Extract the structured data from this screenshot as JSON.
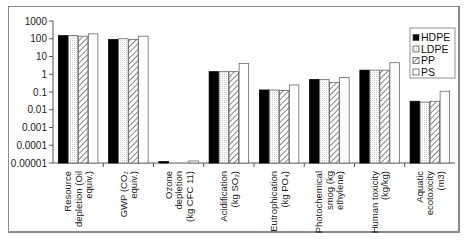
{
  "chart_data": {
    "type": "bar",
    "title": "",
    "xlabel": "",
    "ylabel": "",
    "yscale": "log",
    "ylim": [
      1e-05,
      1000
    ],
    "yticks": [
      "1000",
      "100",
      "10",
      "1",
      "0.1",
      "0.01",
      "0.001",
      "0.0001",
      "0.00001"
    ],
    "ytick_values": [
      1000,
      100,
      10,
      1,
      0.1,
      0.01,
      0.001,
      0.0001,
      1e-05
    ],
    "grid": false,
    "legend_position": "top-right",
    "categories": [
      [
        "Resource",
        "depletion (Oil",
        "equiv.)"
      ],
      [
        "GWP (CO₂",
        "equiv.)"
      ],
      [
        "Ozone",
        "depletion",
        "(kg CFC 11)"
      ],
      [
        "Acidification",
        "(kg SO₂)"
      ],
      [
        "Eutrophication",
        "(kg PO₄)"
      ],
      [
        "Photochemical",
        "smog (kg",
        "ethylene)"
      ],
      [
        "Human toxicity",
        "(kg/kg)"
      ],
      [
        "Aquatic",
        "ecotoxicity",
        "(m3)"
      ]
    ],
    "series": [
      {
        "name": "HDPE",
        "fill": "solid-black",
        "values": [
          150,
          90,
          1.2e-05,
          1.4,
          0.13,
          0.5,
          1.7,
          0.03
        ]
      },
      {
        "name": "LDPE",
        "fill": "dotted-white",
        "values": [
          150,
          100,
          1e-05,
          1.4,
          0.13,
          0.5,
          1.7,
          0.027
        ]
      },
      {
        "name": "PP",
        "fill": "hatched",
        "values": [
          140,
          90,
          1e-05,
          1.4,
          0.12,
          0.35,
          1.7,
          0.03
        ]
      },
      {
        "name": "PS",
        "fill": "white",
        "values": [
          190,
          140,
          1.3e-05,
          4,
          0.25,
          0.65,
          4.5,
          0.11
        ]
      }
    ]
  }
}
